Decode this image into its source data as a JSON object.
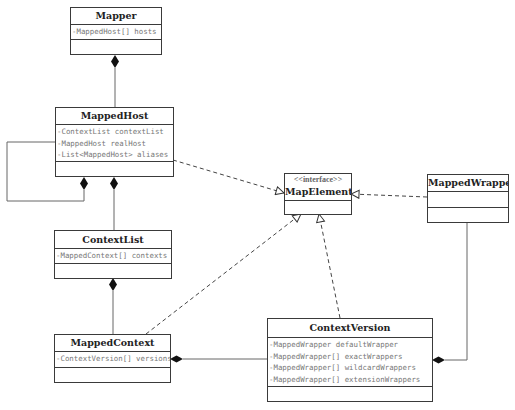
{
  "diagram": {
    "type": "uml-class-diagram",
    "classes": [
      {
        "id": "mapper",
        "name": "Mapper",
        "stereotype": "",
        "attributes": [
          "-MappedHost[] hosts"
        ],
        "operations": []
      },
      {
        "id": "mapped-host",
        "name": "MappedHost",
        "stereotype": "",
        "attributes": [
          "-ContextList contextList",
          "-MappedHost realHost",
          "-List<MappedHost> aliases"
        ],
        "operations": []
      },
      {
        "id": "context-list",
        "name": "ContextList",
        "stereotype": "",
        "attributes": [
          "-MappedContext[] contexts"
        ],
        "operations": []
      },
      {
        "id": "mapped-context",
        "name": "MappedContext",
        "stereotype": "",
        "attributes": [
          "-ContextVersion[] versions"
        ],
        "operations": []
      },
      {
        "id": "map-element",
        "name": "MapElement",
        "stereotype": "<<interface>>",
        "attributes": [],
        "operations": []
      },
      {
        "id": "mapped-wrapper",
        "name": "MappedWrapper",
        "stereotype": "",
        "attributes": [],
        "operations": []
      },
      {
        "id": "context-version",
        "name": "ContextVersion",
        "stereotype": "",
        "attributes": [
          "-MappedWrapper defaultWrapper",
          "-MappedWrapper[] exactWrappers",
          "-MappedWrapper[] wildcardWrappers",
          "-MappedWrapper[] extensionWrappers"
        ],
        "operations": []
      }
    ],
    "relationships": [
      {
        "type": "composition",
        "whole": "Mapper",
        "part": "MappedHost"
      },
      {
        "type": "composition",
        "whole": "MappedHost",
        "part": "MappedHost",
        "note": "self-association (realHost / aliases)"
      },
      {
        "type": "composition",
        "whole": "MappedHost",
        "part": "ContextList"
      },
      {
        "type": "composition",
        "whole": "ContextList",
        "part": "MappedContext"
      },
      {
        "type": "composition",
        "whole": "MappedContext",
        "part": "ContextVersion"
      },
      {
        "type": "composition",
        "whole": "ContextVersion",
        "part": "MappedWrapper"
      },
      {
        "type": "realization",
        "from": "MappedHost",
        "to": "MapElement"
      },
      {
        "type": "realization",
        "from": "MappedContext",
        "to": "MapElement"
      },
      {
        "type": "realization",
        "from": "ContextVersion",
        "to": "MapElement"
      },
      {
        "type": "realization",
        "from": "MappedWrapper",
        "to": "MapElement"
      }
    ],
    "colors": {
      "line": "#555555",
      "border": "#3a3a3a",
      "attribute_text": "#777777",
      "title_text": "#222222",
      "background": "#ffffff"
    }
  }
}
